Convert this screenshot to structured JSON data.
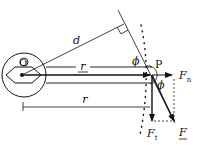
{
  "diagram": {
    "labels": {
      "origin": "O",
      "point": "P",
      "lever_arm": "d",
      "position_vector": "r",
      "distance": "r",
      "angle_top": "ϕ",
      "angle_bottom": "ϕ",
      "normal_force": "F",
      "normal_sub": "n",
      "tangential_force": "F",
      "tangential_sub": "t",
      "force": "F"
    },
    "colors": {
      "ink": "#111111",
      "background": "#ffffff"
    }
  }
}
